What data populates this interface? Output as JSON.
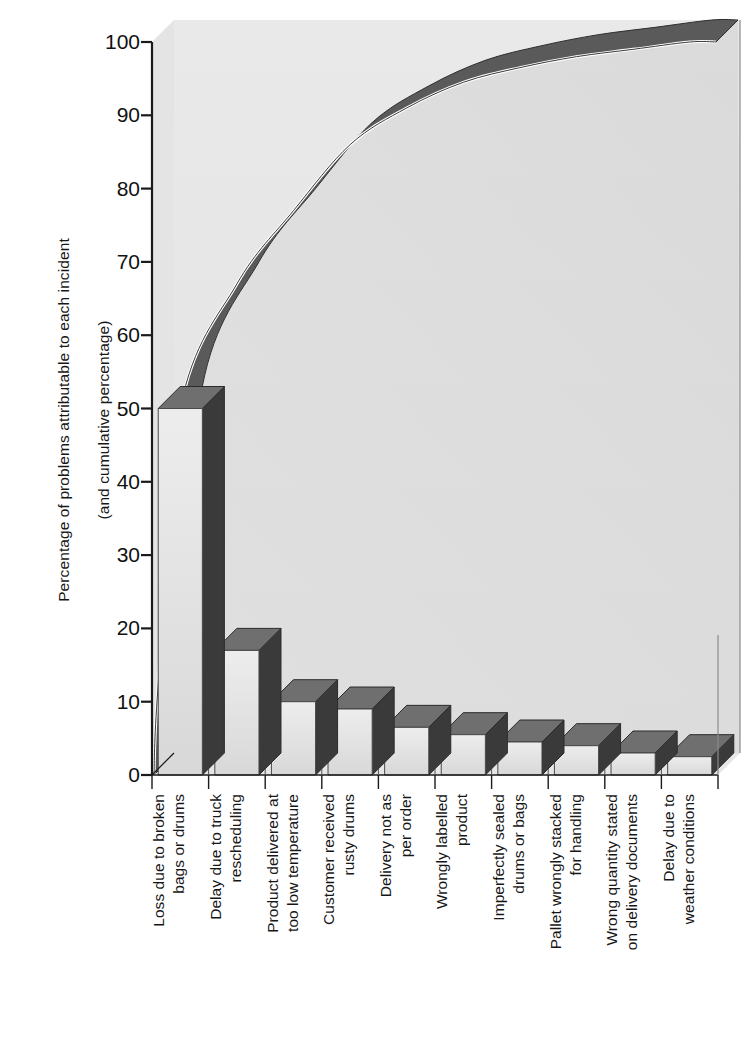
{
  "axes": {
    "y_title_line1": "Percentage of problems attributable to each incident",
    "y_title_line2": "(and cumulative percentage)",
    "y_ticks": [
      "0",
      "10",
      "20",
      "30",
      "40",
      "50",
      "60",
      "70",
      "80",
      "90",
      "100"
    ]
  },
  "colors": {
    "bar_front": "#e3e3e3",
    "bar_top": "#6f6f6f",
    "bar_side": "#3a3a3a",
    "plot_bg": "#e8e8e8",
    "curve_band": "#5a5a5a",
    "curve_highlight": "#ffffff",
    "axis": "#1a1a1a",
    "text": "#161616"
  },
  "chart_data": {
    "type": "bar",
    "title": "",
    "subtitle": "",
    "xlabel": "",
    "ylabel": "Percentage of problems attributable to each incident (and cumulative percentage)",
    "ylim": [
      0,
      100
    ],
    "yticks": [
      0,
      10,
      20,
      30,
      40,
      50,
      60,
      70,
      80,
      90,
      100
    ],
    "grid": false,
    "legend": "none",
    "style": "3d-pareto",
    "categories": [
      "Loss due to broken\nbags or drums",
      "Delay due to truck\nrescheduling",
      "Product delivered at\ntoo low temperature",
      "Customer received\nrusty drums",
      "Delivery not as\nper order",
      "Wrongly labelled\nproduct",
      "Imperfectly sealed\ndrums or bags",
      "Pallet wrongly stacked\nfor handling",
      "Wrong quantity stated\non delivery documents",
      "Delay due to\nweather conditions"
    ],
    "series": [
      {
        "name": "Percentage of problems attributable to each incident",
        "values": [
          50,
          17,
          10,
          9,
          6.5,
          5.5,
          4.5,
          4,
          3,
          2.5
        ]
      },
      {
        "name": "Cumulative percentage",
        "values": [
          50,
          67,
          77,
          86,
          92.5,
          98,
          102.5,
          106.5,
          109.5,
          112
        ]
      }
    ],
    "cumulative_curve": [
      50,
      67,
      77,
      86,
      91,
      94.5,
      96.5,
      98,
      99,
      100
    ],
    "annotations": []
  }
}
